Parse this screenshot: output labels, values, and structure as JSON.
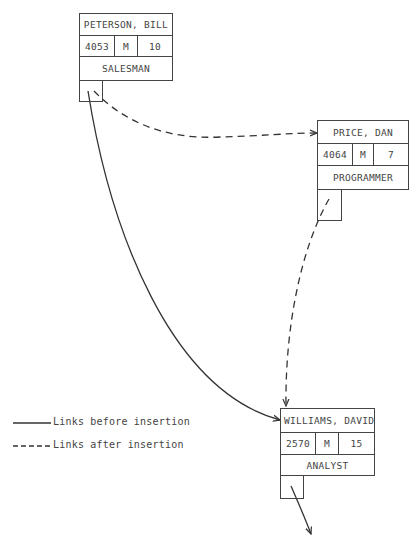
{
  "diagram": {
    "records": [
      {
        "id": "peterson",
        "name": "PETERSON, BILL",
        "id_number": "4053",
        "sex": "M",
        "years": "10",
        "title": "SALESMAN"
      },
      {
        "id": "price",
        "name": "PRICE, DAN",
        "id_number": "4064",
        "sex": "M",
        "years": "7",
        "title": "PROGRAMMER"
      },
      {
        "id": "williams",
        "name": "WILLIAMS, DAVID",
        "id_number": "2570",
        "sex": "M",
        "years": "15",
        "title": "ANALYST"
      }
    ],
    "links": [
      {
        "from": "PETERSON, BILL",
        "to": "WILLIAMS, DAVID",
        "style": "solid",
        "meaning": "before insertion"
      },
      {
        "from": "PETERSON, BILL",
        "to": "PRICE, DAN",
        "style": "dashed",
        "meaning": "after insertion"
      },
      {
        "from": "PRICE, DAN",
        "to": "WILLIAMS, DAVID",
        "style": "dashed",
        "meaning": "after insertion"
      },
      {
        "from": "WILLIAMS, DAVID",
        "to": "next",
        "style": "solid",
        "meaning": "continuation"
      }
    ],
    "legend": [
      {
        "style": "solid",
        "label": "Links before insertion"
      },
      {
        "style": "dashed",
        "label": "Links after insertion"
      }
    ],
    "colors": {
      "line": "#333333",
      "background": "#ffffff"
    }
  }
}
